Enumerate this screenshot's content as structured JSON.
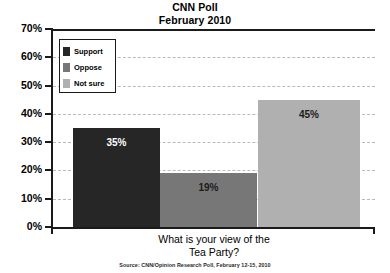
{
  "title": {
    "line1": "CNN Poll",
    "line2": "February 2010"
  },
  "xaxis": {
    "title_line1": "What is your view of the",
    "title_line2": "Tea Party?"
  },
  "source": {
    "text": "Source: CNN/Opinion Research Poll, February 12-15, 2010"
  },
  "legend": {
    "items": [
      {
        "label": "Support",
        "color": "#262626"
      },
      {
        "label": "Oppose",
        "color": "#777777"
      },
      {
        "label": "Not sure",
        "color": "#b0b0b0"
      }
    ]
  },
  "yaxis": {
    "ticks": [
      "70%",
      "60%",
      "50%",
      "40%",
      "30%",
      "20%",
      "10%",
      "0%"
    ]
  },
  "bars": [
    {
      "label": "Support",
      "value_label": "35%",
      "value": 35,
      "color": "#262626",
      "label_color": "light"
    },
    {
      "label": "Oppose",
      "value_label": "19%",
      "value": 19,
      "color": "#777777",
      "label_color": "dark"
    },
    {
      "label": "Not sure",
      "value_label": "45%",
      "value": 45,
      "color": "#b0b0b0",
      "label_color": "dark"
    }
  ],
  "chart_data": {
    "type": "bar",
    "title": "CNN Poll February 2010",
    "subtitle": "February 2010",
    "xlabel": "What is your view of the Tea Party?",
    "ylabel": "",
    "categories": [
      "Support",
      "Oppose",
      "Not sure"
    ],
    "values": [
      35,
      19,
      45
    ],
    "value_labels": [
      "35%",
      "19%",
      "45%"
    ],
    "ylim": [
      0,
      70
    ],
    "ytick_values": [
      0,
      10,
      20,
      30,
      40,
      50,
      60,
      70
    ],
    "ytick_labels": [
      "0%",
      "10%",
      "20%",
      "30%",
      "40%",
      "50%",
      "60%",
      "70%"
    ],
    "units": "percent",
    "grid": true,
    "grid_style": "dashed-horizontal",
    "legend_position": "top-left-inside",
    "series_colors": [
      "#262626",
      "#777777",
      "#b0b0b0"
    ],
    "annotation": "Source: CNN/Opinion Research Poll, February 12-15, 2010"
  }
}
